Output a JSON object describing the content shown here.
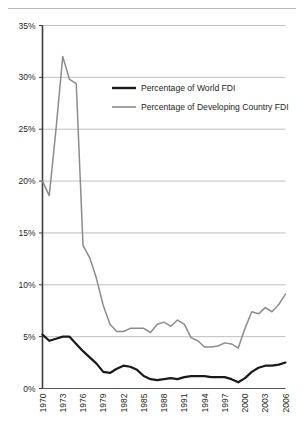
{
  "chart_data": {
    "type": "line",
    "title": "",
    "subtitle": "",
    "xlabel": "",
    "ylabel": "",
    "xlim": [
      1970,
      2006
    ],
    "ylim": [
      0,
      35
    ],
    "y_tick_labels": [
      "0%",
      "5%",
      "10%",
      "15%",
      "20%",
      "25%",
      "30%",
      "35%"
    ],
    "y_tick_values": [
      0,
      5,
      10,
      15,
      20,
      25,
      30,
      35
    ],
    "x_tick_labels": [
      "1970",
      "1973",
      "1976",
      "1979",
      "1982",
      "1985",
      "1988",
      "1991",
      "1994",
      "1997",
      "2000",
      "2003",
      "2006"
    ],
    "x_tick_values": [
      1970,
      1973,
      1976,
      1979,
      1982,
      1985,
      1988,
      1991,
      1994,
      1997,
      2000,
      2003,
      2006
    ],
    "grid": "horizontal",
    "legend_position": "top-center",
    "x": [
      1970,
      1971,
      1972,
      1973,
      1974,
      1975,
      1976,
      1977,
      1978,
      1979,
      1980,
      1981,
      1982,
      1983,
      1984,
      1985,
      1986,
      1987,
      1988,
      1989,
      1990,
      1991,
      1992,
      1993,
      1994,
      1995,
      1996,
      1997,
      1998,
      1999,
      2000,
      2001,
      2002,
      2003,
      2004,
      2005,
      2006
    ],
    "series": [
      {
        "name": "Percentage of World FDI",
        "color": "#1a1a1a",
        "width": 2.2,
        "values": [
          5.2,
          4.6,
          4.8,
          5.0,
          5.0,
          4.3,
          3.6,
          3.0,
          2.4,
          1.6,
          1.5,
          1.9,
          2.2,
          2.1,
          1.8,
          1.2,
          0.9,
          0.8,
          0.9,
          1.0,
          0.9,
          1.1,
          1.2,
          1.2,
          1.2,
          1.1,
          1.1,
          1.1,
          0.9,
          0.6,
          1.0,
          1.6,
          2.0,
          2.2,
          2.2,
          2.3,
          2.5
        ]
      },
      {
        "name": "Percentage of Developing Country FDI",
        "color": "#8c8c8c",
        "width": 1.5,
        "values": [
          20.0,
          18.6,
          25.0,
          32.0,
          29.8,
          29.4,
          13.8,
          12.6,
          10.6,
          8.0,
          6.2,
          5.5,
          5.5,
          5.8,
          5.8,
          5.8,
          5.4,
          6.2,
          6.4,
          6.0,
          6.6,
          6.2,
          4.9,
          4.6,
          4.0,
          4.0,
          4.1,
          4.4,
          4.3,
          3.9,
          5.8,
          7.4,
          7.2,
          7.8,
          7.4,
          8.1,
          9.1
        ]
      }
    ],
    "legend": [
      {
        "label": "Percentage of World FDI",
        "color": "#1a1a1a"
      },
      {
        "label": "Percentage of Developing Country FDI",
        "color": "#8c8c8c"
      }
    ],
    "colors": {
      "world_fdi": "#1a1a1a",
      "developing_fdi": "#8c8c8c",
      "gridline": "#b9b9b9",
      "axis": "#4d4d4d",
      "text": "#231f20",
      "background": "#ffffff"
    }
  }
}
